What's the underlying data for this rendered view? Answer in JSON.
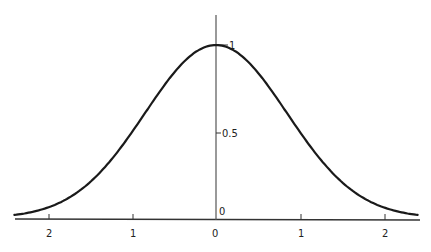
{
  "chart_data": {
    "type": "line",
    "title": "",
    "xlabel": "",
    "ylabel": "",
    "x_ticks": [
      "2",
      "1",
      "0",
      "1",
      "2"
    ],
    "x_tick_values": [
      -2,
      -1,
      0,
      1,
      2
    ],
    "y_ticks": [
      "0",
      "0.5",
      "1"
    ],
    "y_tick_values": [
      0,
      0.5,
      1
    ],
    "xlim": [
      -2.4,
      2.4
    ],
    "ylim": [
      0,
      1.15
    ],
    "grid": false,
    "legend": null,
    "series": [
      {
        "name": "bell curve",
        "x": [
          -2.4,
          -2,
          -1.5,
          -1,
          -0.5,
          0,
          0.5,
          1,
          1.5,
          2,
          2.4
        ],
        "values": [
          0.02,
          0.07,
          0.21,
          0.47,
          0.84,
          1.0,
          0.84,
          0.47,
          0.21,
          0.07,
          0.02
        ]
      }
    ]
  },
  "axis": {
    "x_labels": [
      "2",
      "1",
      "0",
      "1",
      "2"
    ],
    "y_label_top": "1",
    "y_label_mid": "0.5",
    "y_label_zero": "0"
  }
}
